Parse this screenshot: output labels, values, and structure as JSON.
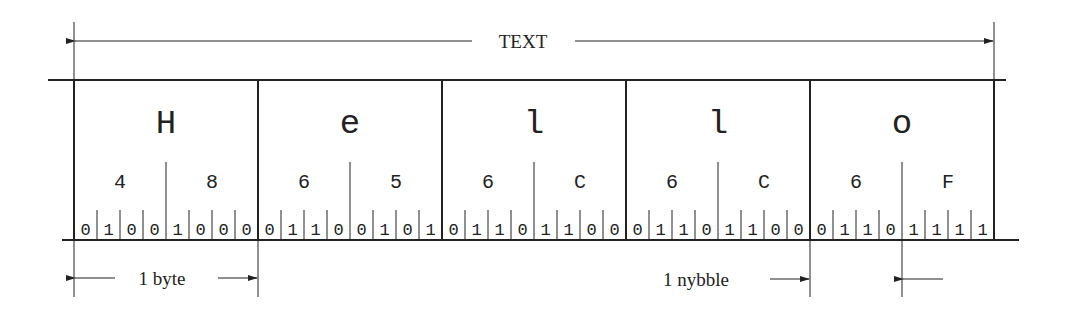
{
  "top_label": "TEXT",
  "bytes": [
    {
      "char": "H",
      "nybbles": [
        "4",
        "8"
      ],
      "bits": [
        "0",
        "1",
        "0",
        "0",
        "1",
        "0",
        "0",
        "0"
      ]
    },
    {
      "char": "e",
      "nybbles": [
        "6",
        "5"
      ],
      "bits": [
        "0",
        "1",
        "1",
        "0",
        "0",
        "1",
        "0",
        "1"
      ]
    },
    {
      "char": "l",
      "nybbles": [
        "6",
        "C"
      ],
      "bits": [
        "0",
        "1",
        "1",
        "0",
        "1",
        "1",
        "0",
        "0"
      ]
    },
    {
      "char": "l",
      "nybbles": [
        "6",
        "C"
      ],
      "bits": [
        "0",
        "1",
        "1",
        "0",
        "1",
        "1",
        "0",
        "0"
      ]
    },
    {
      "char": "o",
      "nybbles": [
        "6",
        "F"
      ],
      "bits": [
        "0",
        "1",
        "1",
        "0",
        "1",
        "1",
        "1",
        "1"
      ]
    }
  ],
  "annotations": {
    "byte_label": "1 byte",
    "nybble_label": "1 nybble"
  },
  "colors": {
    "line": "#222222",
    "background": "#ffffff"
  }
}
